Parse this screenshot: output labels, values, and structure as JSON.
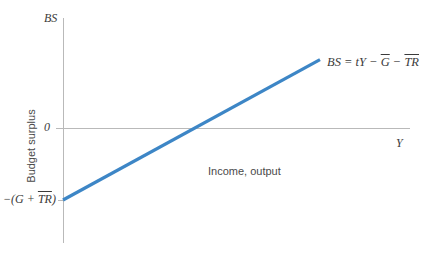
{
  "chart_data": {
    "type": "line",
    "title": "",
    "xlabel": "Income, output",
    "ylabel": "Budget surplus",
    "x_axis_symbol": "Y",
    "y_axis_symbol": "BS",
    "grid": false,
    "legend": "none",
    "xlim": [
      0,
      1
    ],
    "ylim": [
      -1,
      1
    ],
    "zero_tick_label": "0",
    "series": [
      {
        "name": "Budget surplus line",
        "equation_text": "BS = tY − G − TR",
        "color": "#3d86c6",
        "points": [
          {
            "x": 0.0,
            "y": -1.0
          },
          {
            "x": 1.0,
            "y": 0.95
          }
        ],
        "x_intercept": 0.553
      }
    ],
    "annotations": [
      {
        "name": "equation-label",
        "parts": [
          {
            "text": "BS",
            "overline": false
          },
          {
            "text": " = ",
            "overline": false
          },
          {
            "text": "tY",
            "overline": false
          },
          {
            "text": " − ",
            "overline": false
          },
          {
            "text": "G",
            "overline": true
          },
          {
            "text": " − ",
            "overline": false
          },
          {
            "text": "TR",
            "overline": true
          }
        ]
      },
      {
        "name": "intercept-label",
        "parts": [
          {
            "text": "−(",
            "overline": false
          },
          {
            "text": "G",
            "overline": false
          },
          {
            "text": " + ",
            "overline": false
          },
          {
            "text": "TR",
            "overline": true
          },
          {
            "text": ")",
            "overline": false
          }
        ]
      }
    ]
  },
  "labels": {
    "y_axis_symbol": "BS",
    "x_axis_symbol": "Y",
    "zero": "0",
    "y_axis_title": "Budget surplus",
    "x_axis_title": "Income, output",
    "equation": {
      "lhs": "BS",
      "eq": " = ",
      "term_ty": "tY",
      "minus1": " − ",
      "term_g": "G",
      "minus2": " − ",
      "term_tr": "TR"
    },
    "intercept": {
      "open": "−(",
      "term_g": "G",
      "plus": " + ",
      "term_tr": "TR",
      "close": ")"
    }
  },
  "colors": {
    "line": "#3d86c6",
    "axis": "#b9b9b9",
    "math_text": "#3b3b3b",
    "plain_text": "#4a4a4a",
    "background": "#ffffff"
  }
}
